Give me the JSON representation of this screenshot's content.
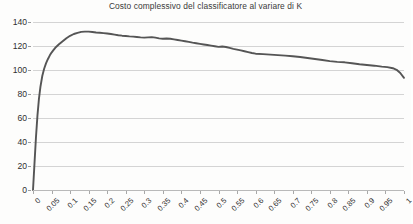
{
  "chart_data": {
    "type": "line",
    "title": "Costo complessivo del classificatore al variare di K",
    "xlabel": "",
    "ylabel": "",
    "xlim": [
      0,
      1
    ],
    "ylim": [
      0,
      140
    ],
    "grid": true,
    "legend": false,
    "legend_position": "none",
    "line_color": "#555555",
    "grid_color": "#d4d4d4",
    "axis_color": "#b9b9b9",
    "text_color": "#2f2f2f",
    "background_color": "#fdfdfc",
    "y_ticks": [
      0,
      20,
      40,
      60,
      80,
      100,
      120,
      140
    ],
    "y_tick_labels": [
      "0",
      "20",
      "40",
      "60",
      "80",
      "100",
      "120",
      "140"
    ],
    "x_ticks": [
      0,
      0.05,
      0.1,
      0.15,
      0.2,
      0.25,
      0.3,
      0.35,
      0.4,
      0.45,
      0.5,
      0.55,
      0.6,
      0.65,
      0.7,
      0.75,
      0.8,
      0.85,
      0.9,
      0.95,
      1
    ],
    "x_tick_labels": [
      "0",
      "0.05",
      "0.1",
      "0.15",
      "0.2",
      "0.25",
      "0.3",
      "0.35",
      "0.4",
      "0.45",
      "0.5",
      "0.55",
      "0.6",
      "0.65",
      "0.7",
      "0.75",
      "0.8",
      "0.85",
      "0.9",
      "0.95",
      "1"
    ],
    "x_tick_label_rotation": -45,
    "series": [
      {
        "name": "Costo complessivo",
        "x": [
          0.0,
          0.004,
          0.008,
          0.012,
          0.016,
          0.02,
          0.025,
          0.03,
          0.035,
          0.04,
          0.045,
          0.05,
          0.055,
          0.06,
          0.07,
          0.08,
          0.09,
          0.1,
          0.11,
          0.12,
          0.13,
          0.14,
          0.15,
          0.16,
          0.17,
          0.18,
          0.19,
          0.2,
          0.21,
          0.22,
          0.23,
          0.24,
          0.25,
          0.26,
          0.27,
          0.28,
          0.29,
          0.3,
          0.31,
          0.32,
          0.33,
          0.34,
          0.35,
          0.36,
          0.37,
          0.38,
          0.39,
          0.4,
          0.41,
          0.42,
          0.43,
          0.44,
          0.45,
          0.46,
          0.47,
          0.48,
          0.49,
          0.5,
          0.51,
          0.52,
          0.53,
          0.54,
          0.55,
          0.56,
          0.57,
          0.58,
          0.59,
          0.6,
          0.62,
          0.64,
          0.66,
          0.68,
          0.7,
          0.72,
          0.74,
          0.76,
          0.78,
          0.8,
          0.82,
          0.84,
          0.86,
          0.88,
          0.9,
          0.92,
          0.94,
          0.955,
          0.97,
          0.98,
          0.99,
          1.0
        ],
        "y": [
          0.0,
          22.0,
          44.0,
          62.0,
          76.0,
          86.0,
          95.0,
          101.0,
          105.5,
          109.0,
          112.0,
          114.5,
          116.5,
          118.5,
          121.5,
          124.0,
          126.5,
          128.5,
          130.0,
          131.0,
          131.8,
          132.0,
          132.0,
          131.7,
          131.3,
          131.0,
          130.7,
          130.4,
          130.0,
          129.5,
          129.0,
          128.6,
          128.3,
          128.0,
          127.8,
          127.5,
          127.2,
          127.0,
          127.2,
          127.4,
          127.0,
          126.4,
          126.0,
          126.3,
          126.0,
          125.5,
          125.0,
          124.5,
          124.0,
          123.4,
          122.8,
          122.3,
          121.8,
          121.3,
          120.8,
          120.3,
          119.8,
          119.3,
          119.6,
          119.2,
          118.4,
          117.6,
          117.0,
          116.3,
          115.6,
          114.9,
          114.2,
          113.6,
          113.2,
          112.8,
          112.4,
          112.0,
          111.5,
          110.8,
          110.0,
          109.2,
          108.3,
          107.4,
          106.8,
          106.4,
          105.6,
          104.8,
          104.2,
          103.6,
          102.8,
          102.4,
          101.5,
          100.2,
          97.5,
          93.5
        ]
      }
    ]
  }
}
